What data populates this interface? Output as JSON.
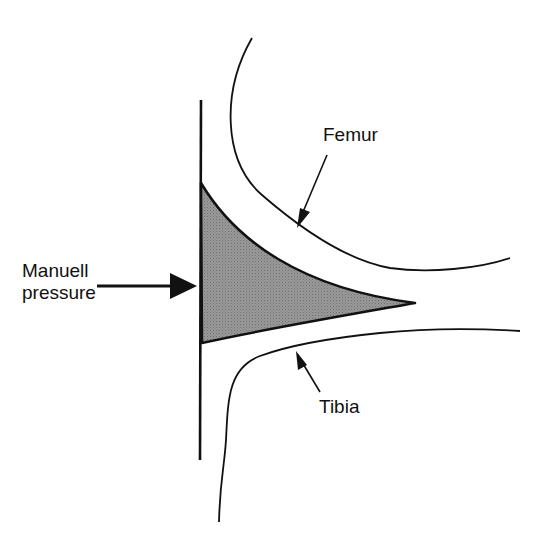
{
  "diagram": {
    "labels": {
      "pressure_line1": "Manuell",
      "pressure_line2": "pressure",
      "femur": "Femur",
      "tibia": "Tibia"
    },
    "colors": {
      "stroke": "#111111",
      "wedge_fill": "#8c8c8c",
      "background": "#ffffff"
    }
  }
}
